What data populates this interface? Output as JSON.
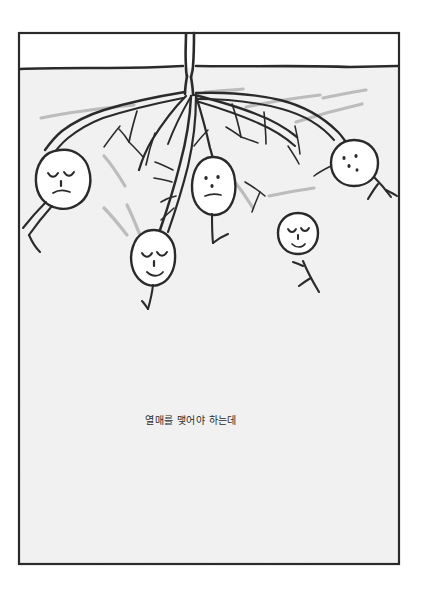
{
  "page": {
    "kind": "hand-drawn-comic-panel",
    "width": 427,
    "height": 597,
    "background_color": "#ffffff"
  },
  "panel": {
    "name": "potato-root-panel",
    "frame": {
      "x": 18,
      "y": 32,
      "width": 382,
      "height": 533,
      "border_color": "#2a2a2a",
      "border_width": 2
    },
    "sky": {
      "label": "above-ground",
      "color": "#ffffff"
    },
    "soil": {
      "label": "underground-soil",
      "color": "#f2f2f2"
    },
    "ground_line": {
      "label": "ground-surface-line",
      "y": 68,
      "color": "#2a2a2a"
    }
  },
  "scene": {
    "title": "potato plant root system with five tubers",
    "ink_color": "#2a2a2a",
    "shadow_color": "#b9b9b9",
    "tuber_fill": "#ffffff",
    "stem": {
      "label": "plant-stem-above-ground"
    },
    "tubers": [
      {
        "id": "tuber-left",
        "label": "sleepy potato left",
        "expression": "eyes-closed-frown",
        "cx": 62,
        "cy": 178,
        "rx": 25,
        "ry": 28,
        "rotation": -12
      },
      {
        "id": "tuber-center",
        "label": "plain-faced potato center",
        "expression": "dot-eyes-flat-mouth",
        "cx": 213,
        "cy": 185,
        "rx": 21,
        "ry": 26,
        "rotation": 4
      },
      {
        "id": "tuber-lower-center",
        "label": "smiling potato lower center",
        "expression": "eyes-closed-smile",
        "cx": 152,
        "cy": 257,
        "rx": 21,
        "ry": 25,
        "rotation": -6
      },
      {
        "id": "tuber-right-small",
        "label": "small smiling potato right",
        "expression": "eyes-closed-smile",
        "cx": 298,
        "cy": 233,
        "rx": 20,
        "ry": 20,
        "rotation": 0
      },
      {
        "id": "tuber-top-right",
        "label": "dotted-face potato top right",
        "expression": "dot-eyes-dot-mouth",
        "cx": 355,
        "cy": 162,
        "rx": 23,
        "ry": 23,
        "rotation": 8
      }
    ]
  },
  "caption": {
    "name": "caption-korean",
    "text": "열매를 맺어야 하는데",
    "translation_hint": "it has to bear fruit",
    "x": 191,
    "y": 424,
    "color": "#2b2b2b"
  }
}
